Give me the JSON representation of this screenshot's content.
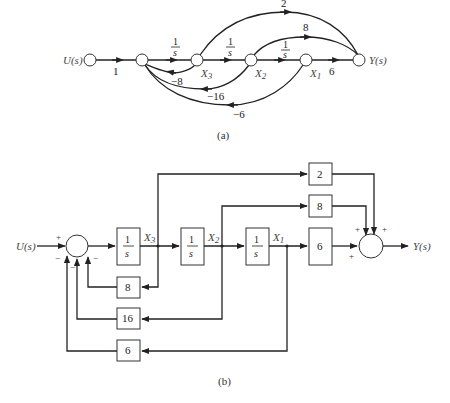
{
  "figure_a": {
    "caption": "(a)",
    "input_label": "U(s)",
    "output_label": "Y(s)",
    "state_labels": {
      "x3": "X",
      "x3_sub": "3",
      "x2": "X",
      "x2_sub": "2",
      "x1": "X",
      "x1_sub": "1"
    },
    "gains": {
      "input": "1",
      "integrator_num": "1",
      "integrator_den": "s",
      "output_x1": "6",
      "feedforward_x3": "2",
      "feedforward_x2": "8",
      "feedback_x3": "−8",
      "feedback_x2": "−16",
      "feedback_x1": "−6"
    }
  },
  "figure_b": {
    "caption": "(b)",
    "input_label": "U(s)",
    "output_label": "Y(s)",
    "state_labels": {
      "x3": "X",
      "x3_sub": "3",
      "x2": "X",
      "x2_sub": "2",
      "x1": "X",
      "x1_sub": "1"
    },
    "blocks": {
      "integrator_num": "1",
      "integrator_den": "s",
      "ff_top": "2",
      "ff_mid": "8",
      "ff_out": "6",
      "fb_x3": "8",
      "fb_x2": "16",
      "fb_x1": "6"
    },
    "signs": {
      "sum1_input": "+",
      "sum1_fb1": "−",
      "sum1_fb2": "−",
      "sum1_fb3": "−",
      "sum2_a": "+",
      "sum2_b": "+",
      "sum2_c": "+"
    }
  }
}
